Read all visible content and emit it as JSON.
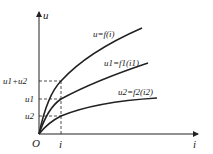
{
  "diagram": {
    "title": "",
    "axes": {
      "y_label": "u",
      "x_label": "i",
      "origin_label": "O"
    },
    "curves": [
      {
        "id": "total",
        "label_main": "u",
        "label_rest": "=f(i)",
        "label": "u=f(i)"
      },
      {
        "id": "u1",
        "label": "u1=f1(i1)"
      },
      {
        "id": "u2",
        "label": "u2=f2(i2)"
      }
    ],
    "y_ticks": [
      {
        "label": "u1+u2"
      },
      {
        "label": "u1"
      },
      {
        "label": "u2"
      }
    ],
    "x_ticks": [
      {
        "label": "i"
      }
    ],
    "colors": {
      "line": "#222222",
      "background": "#ffffff"
    }
  }
}
